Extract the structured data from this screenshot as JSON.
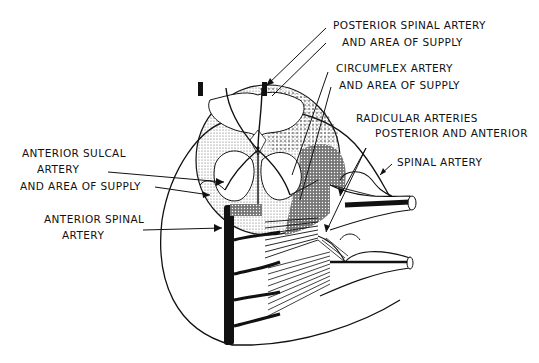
{
  "diagram": {
    "labels": {
      "posterior_spinal_l1": "POSTERIOR SPINAL ARTERY",
      "posterior_spinal_l2": "AND AREA OF SUPPLY",
      "circumflex_l1": "CIRCUMFLEX ARTERY",
      "circumflex_l2": "AND AREA OF SUPPLY",
      "radicular_l1": "RADICULAR ARTERIES",
      "radicular_l2": "POSTERIOR AND ANTERIOR",
      "spinal_artery": "SPINAL ARTERY",
      "anterior_sulcal_l1": "ANTERIOR SULCAL",
      "anterior_sulcal_l2": "ARTERY",
      "anterior_sulcal_l3": "AND AREA OF SUPPLY",
      "anterior_spinal_l1": "ANTERIOR SPINAL",
      "anterior_spinal_l2": "ARTERY"
    },
    "colors": {
      "ink": "#111111",
      "background": "#ffffff"
    }
  }
}
